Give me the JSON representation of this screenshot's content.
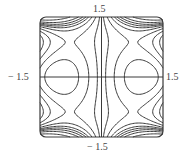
{
  "chart_data": {
    "type": "contour",
    "title": "",
    "xlabel": "",
    "ylabel": "",
    "xlim": [
      -1.5,
      1.5
    ],
    "ylim": [
      -1.5,
      1.5
    ],
    "grid": false,
    "legend": null,
    "axes_through_origin": true,
    "tick_labels": {
      "x_min": "− 1.5",
      "x_max": "1.5",
      "y_min": "− 1.5",
      "y_max": "1.5"
    },
    "critical_points": [
      {
        "type": "center",
        "x": -1.0,
        "y": 0.0
      },
      {
        "type": "saddle",
        "x": -1.0,
        "y": 0.87
      },
      {
        "type": "saddle",
        "x": -1.0,
        "y": -0.87
      },
      {
        "type": "saddle",
        "x": 1.0,
        "y": 0.0
      },
      {
        "type": "center",
        "x": 1.0,
        "y": 0.87
      },
      {
        "type": "center",
        "x": 1.0,
        "y": -0.87
      }
    ],
    "line_color": "#3a3a3a",
    "frame_color": "#3a3a3a"
  },
  "labels": {
    "top": "1.5",
    "bottom": "− 1.5",
    "left": "− 1.5",
    "right": "1.5"
  }
}
